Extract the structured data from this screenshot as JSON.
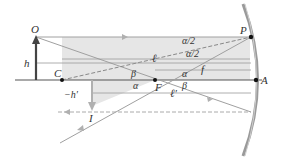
{
  "diagram": {
    "labels": {
      "object_top": "O",
      "object_height": "h",
      "center": "C",
      "focal_point": "F",
      "vertex": "A",
      "mirror_point": "P",
      "image_point": "I",
      "image_height": "−h′",
      "object_distance": "ℓ",
      "image_distance": "ℓ′",
      "focal_length": "f",
      "half_angle_top": "α/2",
      "half_angle_bottom": "α/2",
      "alpha_upper": "α",
      "alpha_lower": "α",
      "beta_upper": "β",
      "beta_lower": "β"
    },
    "colors": {
      "shade": "#e6e6e6",
      "ray": "#a0a0a0",
      "axis": "#555555",
      "object_arrow": "#444444",
      "image_arrow": "#b0b0b0",
      "mirror": "#9a9a9a",
      "text": "#333333"
    }
  }
}
